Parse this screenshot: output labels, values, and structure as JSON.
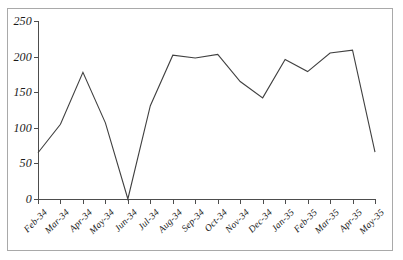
{
  "chart_data": {
    "type": "line",
    "title": "",
    "subtitle": "",
    "xlabel": "",
    "ylabel": "",
    "grid": false,
    "legend": false,
    "legend_position": "none",
    "line_color": "#404040",
    "border_color": "#a9a9a9",
    "axis_color": "#4d4d4d",
    "ylim": [
      0,
      250
    ],
    "ytick_labels": [
      "0",
      "50",
      "100",
      "150",
      "200",
      "250"
    ],
    "ytick_values": [
      0,
      50,
      100,
      150,
      200,
      250
    ],
    "categories": [
      "Feb-34",
      "Mar-34",
      "Apr-34",
      "May-34",
      "Jun-34",
      "Jul-34",
      "Aug-34",
      "Sep-34",
      "Oct-34",
      "Nov-34",
      "Dec-34",
      "Jan-35",
      "Feb-35",
      "Mar-35",
      "Apr-35",
      "May-35"
    ],
    "values": [
      65,
      105,
      178,
      107,
      0,
      131,
      202,
      198,
      203,
      165,
      142,
      196,
      179,
      205,
      209,
      66
    ],
    "series": [
      {
        "name": "",
        "values": [
          65,
          105,
          178,
          107,
          0,
          131,
          202,
          198,
          203,
          165,
          142,
          196,
          179,
          205,
          209,
          66
        ]
      }
    ]
  }
}
